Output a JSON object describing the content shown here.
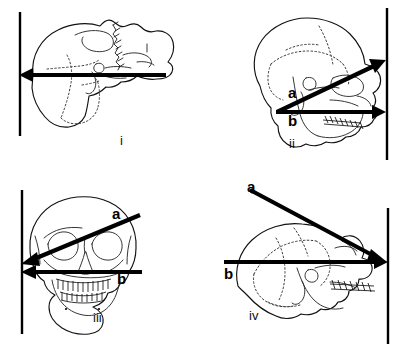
{
  "figure": {
    "background_color": "#ffffff",
    "ink_color": "#000000",
    "width": 404,
    "height": 352
  },
  "panels": [
    {
      "id": "i",
      "caption": "i",
      "view": "lateral-skull-left-facing",
      "reference_line": "vertical",
      "axes": [
        {
          "key": "single",
          "label": "",
          "orientation": "horizontal",
          "arrow_direction": "left",
          "note": "single horizontal axis, unlabeled"
        }
      ]
    },
    {
      "id": "ii",
      "caption": "ii",
      "view": "lateral-skull-right-facing",
      "reference_line": "vertical",
      "axes": [
        {
          "key": "a",
          "label": "a",
          "orientation": "oblique-up-right",
          "arrow_direction": "right"
        },
        {
          "key": "b",
          "label": "b",
          "orientation": "horizontal",
          "arrow_direction": "right"
        }
      ]
    },
    {
      "id": "iii",
      "caption": "iii",
      "view": "frontal-skull",
      "reference_line": "vertical",
      "axes": [
        {
          "key": "a",
          "label": "a",
          "orientation": "oblique-down-left",
          "arrow_direction": "left"
        },
        {
          "key": "b",
          "label": "b",
          "orientation": "horizontal",
          "arrow_direction": "left"
        }
      ]
    },
    {
      "id": "iv",
      "caption": "iv",
      "view": "lateral-skull-right-facing",
      "reference_line": "vertical",
      "axes": [
        {
          "key": "a",
          "label": "a",
          "orientation": "oblique-down-right",
          "arrow_direction": "right"
        },
        {
          "key": "b",
          "label": "b",
          "orientation": "horizontal",
          "arrow_direction": "right"
        }
      ]
    }
  ]
}
